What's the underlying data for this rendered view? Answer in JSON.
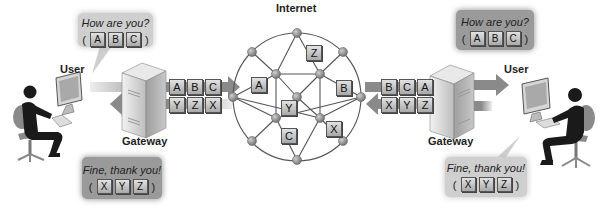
{
  "diagram": {
    "title_internet": "Internet",
    "left": {
      "user_label": "User",
      "gateway_label": "Gateway",
      "bubble_top": {
        "text": "How are you?",
        "packets": [
          "A",
          "B",
          "C"
        ]
      },
      "bubble_bottom": {
        "text": "Fine, thank you!",
        "packets": [
          "X",
          "Y",
          "Z"
        ]
      },
      "outgoing_packets": [
        "A",
        "B",
        "C"
      ],
      "incoming_packets": [
        "Y",
        "Z",
        "X"
      ]
    },
    "right": {
      "user_label": "User",
      "gateway_label": "Gateway",
      "bubble_top": {
        "text": "How are you?",
        "packets": [
          "A",
          "B",
          "C"
        ]
      },
      "bubble_bottom": {
        "text": "Fine, thank you!",
        "packets": [
          "X",
          "Y",
          "Z"
        ]
      },
      "incoming_packets": [
        "B",
        "C",
        "A"
      ],
      "outgoing_packets": [
        "X",
        "Y",
        "Z"
      ]
    },
    "network_packets": {
      "A": "A",
      "Z": "Z",
      "B": "B",
      "Y": "Y",
      "C": "C",
      "X": "X"
    },
    "colors": {
      "bubble_light": "#cfcfcf",
      "bubble_dark": "#9a9a9a",
      "node": "#8c8c8c",
      "line": "#555555",
      "arrow": "#8a8a8a",
      "person": "#1a1a1a",
      "chair": "#8a8a8a"
    }
  }
}
